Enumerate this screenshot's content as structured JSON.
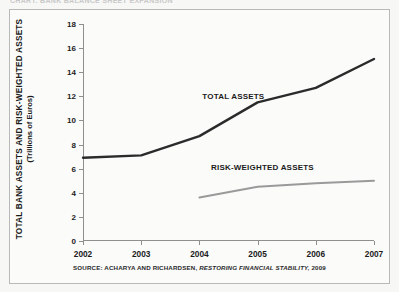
{
  "figure": {
    "top_clipped_text": "CHART: BANK BALANCE SHEET EXPANSION",
    "source_prefix": "SOURCE: ACHARYA AND RICHARDSEN,",
    "source_title": "RESTORING FINANCIAL STABILITY,",
    "source_year": "2009"
  },
  "axis": {
    "y_title_line1": "TOTAL BANK ASSETS AND RISK-WEIGHTED ASSETS",
    "y_title_line2": "(Trillions of Euros)"
  },
  "chart_data": {
    "type": "line",
    "title": "",
    "xlabel": "",
    "ylabel": "TOTAL BANK ASSETS AND RISK-WEIGHTED ASSETS (Trillions of Euros)",
    "x": [
      "2002",
      "2003",
      "2004",
      "2005",
      "2006",
      "2007"
    ],
    "xlim": [
      2002,
      2007
    ],
    "ylim": [
      0,
      18
    ],
    "yticks": [
      0,
      2,
      4,
      6,
      8,
      10,
      12,
      14,
      16,
      18
    ],
    "ytick_labels": [
      "0",
      "2",
      "4",
      "6",
      "8",
      "10",
      "12",
      "14",
      "16",
      "18"
    ],
    "grid": false,
    "legend": "inline-annotations",
    "series": [
      {
        "name": "TOTAL ASSETS",
        "color": "#2b2b2b",
        "width": 2.4,
        "x": [
          "2002",
          "2003",
          "2004",
          "2005",
          "2006",
          "2007"
        ],
        "values": [
          6.9,
          7.1,
          8.7,
          11.5,
          12.7,
          15.1
        ],
        "label_x": 2004.05,
        "label_y": 12.4
      },
      {
        "name": "RISK-WEIGHTED ASSETS",
        "color": "#9a9a9a",
        "width": 2.0,
        "x": [
          "2004",
          "2005",
          "2006",
          "2007"
        ],
        "values": [
          3.6,
          4.5,
          4.8,
          5.0
        ],
        "label_x": 2004.2,
        "label_y": 6.5
      }
    ]
  }
}
